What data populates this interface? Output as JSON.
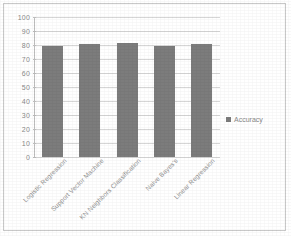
{
  "chart_data": {
    "type": "bar",
    "title": "",
    "xlabel": "",
    "ylabel": "",
    "categories": [
      "Logistic Regression",
      "Support Vector Machine",
      "KN Neighbors Classification",
      "Naive Bayes's",
      "Linear Regression"
    ],
    "series": [
      {
        "name": "Accuracy",
        "values": [
          79,
          81,
          81.5,
          79.5,
          81
        ]
      }
    ],
    "ylim": [
      0,
      100
    ],
    "ytick_step": 10,
    "yticks": [
      0,
      10,
      20,
      30,
      40,
      50,
      60,
      70,
      80,
      90,
      100
    ],
    "ytick_labels": [
      "0",
      "10",
      "20",
      "30",
      "40",
      "50",
      "60",
      "70",
      "80",
      "90",
      "100"
    ],
    "grid": true,
    "grid_axis": "y",
    "legend": {
      "entries": [
        "Accuracy"
      ],
      "position": "right"
    },
    "colors": {
      "bar": "#7c7c7c",
      "gridline": "#d6d6d6",
      "axis": "#bdbdbd",
      "text": "#8a8a8a",
      "background": "#ffffff",
      "border": "#c9c9c9"
    }
  }
}
